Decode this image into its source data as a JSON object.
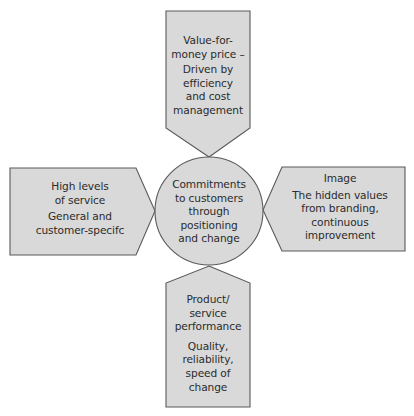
{
  "diagram": {
    "center": {
      "lines": [
        "Commitments",
        "to customers",
        "through",
        "positioning",
        "and change"
      ]
    },
    "top": {
      "title_lines": [
        "Value-for-",
        "money price –"
      ],
      "body_lines": [
        "Driven by",
        "efficiency",
        "and cost",
        "management"
      ]
    },
    "left": {
      "title_lines": [
        "High levels",
        "of service"
      ],
      "body_lines": [
        "General and",
        "customer-specifc"
      ]
    },
    "right": {
      "title_lines": [
        "Image"
      ],
      "body_lines": [
        "The hidden values",
        "from branding,",
        "continuous",
        "improvement"
      ]
    },
    "bottom": {
      "title_lines": [
        "Product/",
        "service",
        "performance"
      ],
      "body_lines": [
        "Quality,",
        "reliability,",
        "speed of",
        "change"
      ]
    },
    "colors": {
      "shape_fill": "#d9d9d9",
      "shape_stroke": "#5a5a5a",
      "text": "#2b2b2b",
      "background": "#ffffff"
    }
  }
}
